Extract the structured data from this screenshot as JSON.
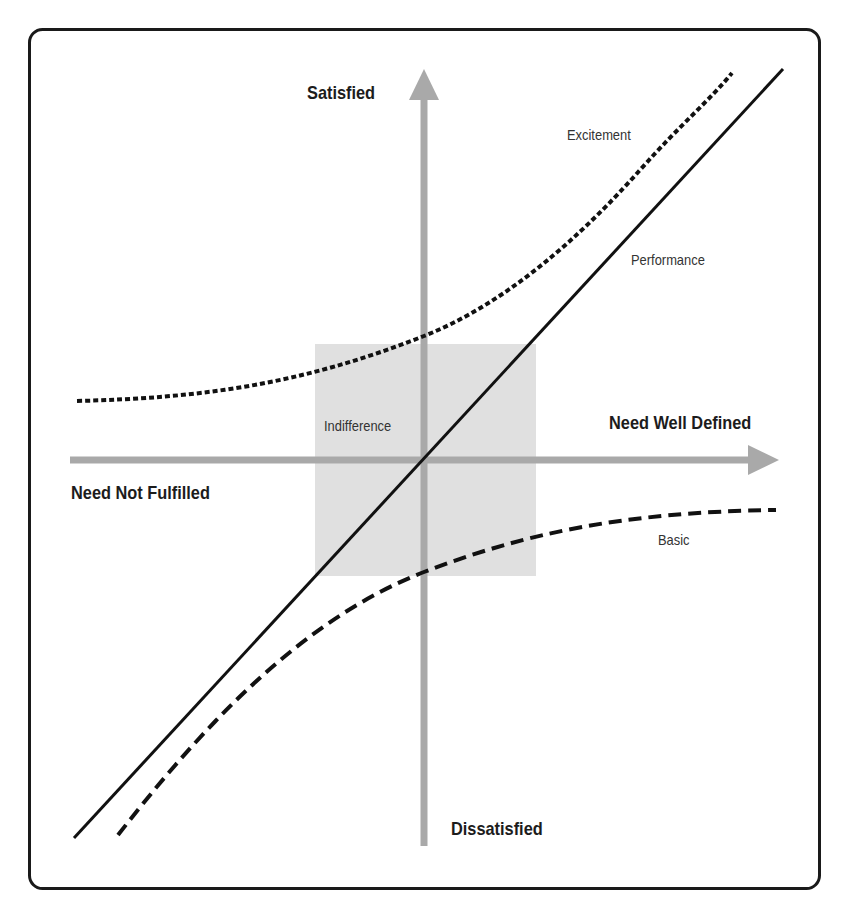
{
  "diagram": {
    "axes": {
      "y_top": "Satisfied",
      "y_bottom": "Dissatisfied",
      "x_left": "Need Not Fulfilled",
      "x_right": "Need Well Defined"
    },
    "curves": [
      {
        "name": "Excitement",
        "style": "dotted",
        "label": "Excitement"
      },
      {
        "name": "Performance",
        "style": "solid",
        "label": "Performance"
      },
      {
        "name": "Basic",
        "style": "dashed",
        "label": "Basic"
      }
    ],
    "zones": [
      {
        "name": "Indifference",
        "label": "Indifference",
        "fill": "#e0e0e0"
      }
    ],
    "colors": {
      "axis": "#a9a9a9",
      "curve": "#111111",
      "frame": "#1a1a1a",
      "zone": "#e0e0e0"
    }
  }
}
